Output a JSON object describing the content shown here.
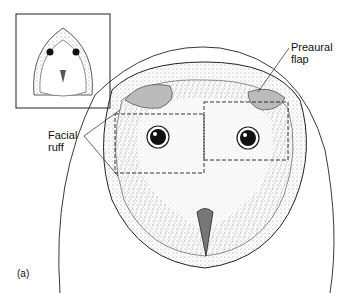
{
  "figure": {
    "panel_label": "(a)",
    "labels": {
      "preaural_flap": [
        "Preaural",
        "flap"
      ],
      "facial_ruff": [
        "Facial",
        "ruff"
      ]
    },
    "inset": {
      "description": "small barn owl face",
      "frame_color": "#222222"
    },
    "dashed_boxes": [
      {
        "name": "left-eye-region",
        "x": 115,
        "y": 114,
        "w": 89,
        "h": 59
      },
      {
        "name": "right-eye-region",
        "x": 204,
        "y": 102,
        "w": 84,
        "h": 58
      }
    ],
    "colors": {
      "ink": "#1a1a1a",
      "paper": "#ffffff",
      "stipple": "#888888"
    }
  }
}
